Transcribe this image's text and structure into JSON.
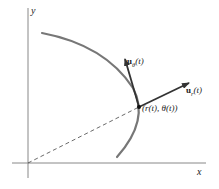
{
  "diagram": {
    "axes": {
      "x_label": "x",
      "y_label": "y",
      "axis_color": "#888888"
    },
    "curve": {
      "color": "#777777",
      "description": "path of a moving point in polar coordinates"
    },
    "point": {
      "label": "(r(t), θ(t))"
    },
    "vectors": [
      {
        "name": "u_r",
        "bold": "u",
        "sub": "r",
        "arg": "(t)",
        "color": "#333333"
      },
      {
        "name": "u_theta",
        "bold": "u",
        "sub": "θ",
        "arg": "(t)",
        "color": "#333333"
      }
    ],
    "radius_line": {
      "style": "dashed",
      "from": "origin",
      "to": "point"
    }
  }
}
